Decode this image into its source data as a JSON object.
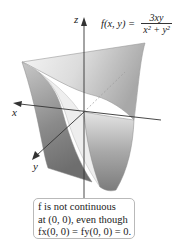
{
  "figure": {
    "type": "3d-surface-plot",
    "function": {
      "lhs": "f(x, y) =",
      "numerator": "3xy",
      "denominator": "x² + y²"
    },
    "axes": {
      "z_label": "z",
      "x_label": "x",
      "y_label": "y"
    },
    "annotation": {
      "line1": "f is not continuous",
      "line2": "at (0, 0), even though",
      "line3": "fx(0, 0) = fy(0, 0) = 0."
    },
    "colors": {
      "surface_light": "#f2f2f2",
      "surface_mid": "#b5b5b5",
      "surface_dark": "#7a7a7a",
      "axis": "#333333",
      "box_border": "#b9b9b9"
    }
  }
}
